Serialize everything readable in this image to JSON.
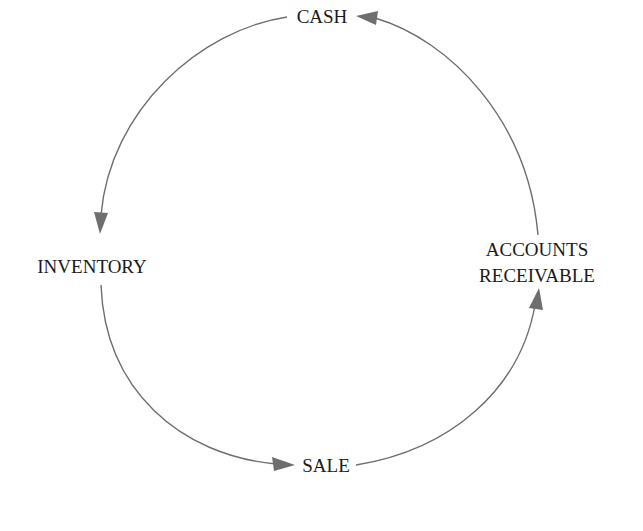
{
  "diagram": {
    "title": "",
    "type": "cycle",
    "nodes": [
      {
        "id": "cash",
        "label": "CASH"
      },
      {
        "id": "inventory",
        "label": "INVENTORY"
      },
      {
        "id": "sale",
        "label": "SALE"
      },
      {
        "id": "ar",
        "label_line1": "ACCOUNTS",
        "label_line2": "RECEIVABLE"
      }
    ],
    "edges": [
      {
        "from": "cash",
        "to": "inventory",
        "direction": "counter-clockwise"
      },
      {
        "from": "inventory",
        "to": "sale",
        "direction": "counter-clockwise"
      },
      {
        "from": "sale",
        "to": "ar",
        "direction": "counter-clockwise"
      },
      {
        "from": "ar",
        "to": "cash",
        "direction": "counter-clockwise"
      }
    ],
    "colors": {
      "arrow": "#6e6e6e",
      "text": "#1a1a1a",
      "background": "#ffffff"
    }
  }
}
